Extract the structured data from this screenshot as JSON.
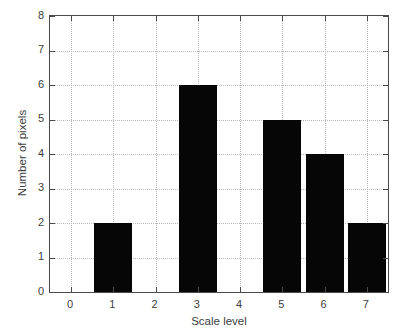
{
  "chart_data": {
    "type": "bar",
    "title": "",
    "subtitle": "",
    "xlabel": "Scale level",
    "ylabel": "Number of pixels",
    "categories": [
      "0",
      "1",
      "2",
      "3",
      "4",
      "5",
      "6",
      "7"
    ],
    "values": [
      0,
      2,
      0,
      6,
      0,
      5,
      4,
      2
    ],
    "series": [
      {
        "name": "Number of pixels",
        "values": [
          0,
          2,
          0,
          6,
          0,
          5,
          4,
          2
        ]
      }
    ],
    "xlim": [
      -0.5,
      7.5
    ],
    "ylim": [
      0,
      8
    ],
    "x_tick_labels": [
      "0",
      "1",
      "2",
      "3",
      "4",
      "5",
      "6",
      "7"
    ],
    "y_tick_labels": [
      "0",
      "1",
      "2",
      "3",
      "4",
      "5",
      "6",
      "7",
      "8"
    ],
    "y_ticks": [
      0,
      1,
      2,
      3,
      4,
      5,
      6,
      7,
      8
    ],
    "grid": true,
    "grid_style": "dotted",
    "grid_color": "#b9b9b9",
    "legend": null,
    "legend_position": "none",
    "bar_color": "#060606",
    "bar_width": 0.9,
    "axis_color": "#4a4a4a",
    "background_color": "#ffffff",
    "annotations": []
  },
  "axes": {
    "x_title": "Scale level",
    "y_title": "Number of pixels"
  }
}
